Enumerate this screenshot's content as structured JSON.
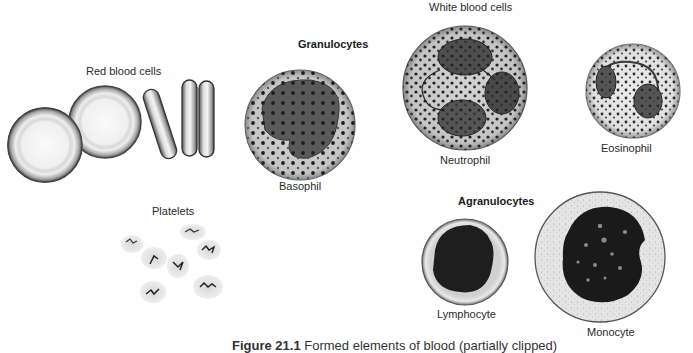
{
  "figure": {
    "groups": {
      "red_blood_cells": "Red blood cells",
      "white_blood_cells": "White blood cells",
      "granulocytes": "Granulocytes",
      "agranulocytes": "Agranulocytes",
      "platelets": "Platelets"
    },
    "cells": {
      "basophil": "Basophil",
      "neutrophil": "Neutrophil",
      "eosinophil": "Eosinophil",
      "lymphocyte": "Lymphocyte",
      "monocyte": "Monocyte"
    },
    "caption": {
      "number": "Figure 21.1",
      "text": "Formed elements of blood (partially clipped)"
    }
  }
}
